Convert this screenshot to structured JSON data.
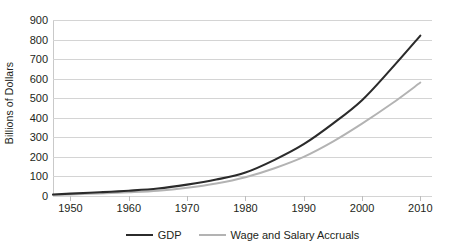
{
  "chart_data": {
    "type": "line",
    "title": "",
    "subtitle": "",
    "xlabel": "",
    "ylabel": "Billions of Dollars",
    "xlim": [
      1947,
      2012
    ],
    "ylim": [
      0,
      900
    ],
    "ytick_step": 100,
    "xtick_step": 10,
    "grid": true,
    "grid_axis": "y",
    "legend_position": "bottom",
    "y_ticks": [
      0,
      100,
      200,
      300,
      400,
      500,
      600,
      700,
      800,
      900
    ],
    "x_ticks": [
      1950,
      1960,
      1970,
      1980,
      1990,
      2000,
      2010
    ],
    "y_tick_labels": [
      "0",
      "100",
      "200",
      "300",
      "400",
      "500",
      "600",
      "700",
      "800",
      "900"
    ],
    "x_tick_labels": [
      "1950",
      "1960",
      "1970",
      "1980",
      "1990",
      "2000",
      "2010"
    ],
    "x": [
      1947,
      1950,
      1955,
      1960,
      1965,
      1970,
      1975,
      1980,
      1985,
      1990,
      1995,
      2000,
      2005,
      2010
    ],
    "series": [
      {
        "name": "GDP",
        "color": "#2b2b2b",
        "width": 2.1,
        "values": [
          8,
          12,
          19,
          27,
          38,
          58,
          84,
          120,
          185,
          265,
          370,
          490,
          650,
          820
        ]
      },
      {
        "name": "Wage and Salary Accruals",
        "color": "#b3b3b3",
        "width": 1.9,
        "values": [
          5,
          8,
          13,
          19,
          27,
          42,
          64,
          96,
          142,
          200,
          278,
          370,
          470,
          580
        ]
      }
    ]
  },
  "legend": {
    "items": [
      {
        "label": "GDP",
        "color": "#2b2b2b"
      },
      {
        "label": "Wage and Salary Accruals",
        "color": "#b3b3b3"
      }
    ]
  },
  "colors": {
    "gridline": "#d4d4d4",
    "axis": "#bdbdbd",
    "text": "#231f20",
    "background": "#ffffff"
  }
}
